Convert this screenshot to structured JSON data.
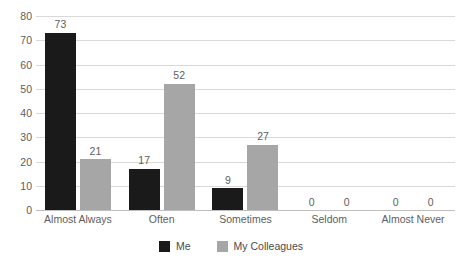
{
  "chart_data": {
    "type": "bar",
    "title": "",
    "xlabel": "",
    "ylabel": "",
    "ylim": [
      0,
      80
    ],
    "ytick_step": 10,
    "yticks": [
      80,
      70,
      60,
      50,
      40,
      30,
      20,
      10,
      0
    ],
    "grid": true,
    "legend_position": "bottom-center",
    "categories": [
      "Almost Always",
      "Often",
      "Sometimes",
      "Seldom",
      "Almost Never"
    ],
    "series": [
      {
        "name": "Me",
        "color": "#1a1a1a",
        "values": [
          73,
          17,
          9,
          0,
          0
        ]
      },
      {
        "name": "My Colleagues",
        "color": "#a6a6a6",
        "values": [
          21,
          52,
          27,
          0,
          0
        ]
      }
    ],
    "data_labels": true
  },
  "colors": {
    "series_me": "#1a1a1a",
    "series_colleagues": "#a6a6a6",
    "gridline": "#d9d9d9",
    "axis": "#bfbfbf",
    "text": "#5e5e5e",
    "background": "#ffffff"
  },
  "footnote": ""
}
